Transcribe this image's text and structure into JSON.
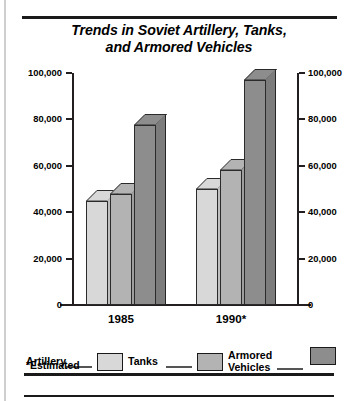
{
  "chart_data": {
    "type": "bar",
    "title": "Trends in Soviet Artillery, Tanks, and Armored Vehicles",
    "title_line1": "Trends in Soviet Artillery, Tanks,",
    "title_line2": "and Armored Vehicles",
    "categories": [
      "1985",
      "1990*"
    ],
    "series": [
      {
        "name": "Artillery",
        "values": [
          45000,
          50000
        ],
        "color": "#d8d8d8"
      },
      {
        "name": "Tanks",
        "values": [
          48000,
          58000
        ],
        "color": "#b3b3b3"
      },
      {
        "name": "Armored\nVehicles",
        "values": [
          77500,
          97000
        ],
        "color": "#8d8d8d"
      }
    ],
    "xlabel": "",
    "ylabel": "",
    "ylim": [
      0,
      100000
    ],
    "ytick_values": [
      0,
      20000,
      40000,
      60000,
      80000,
      100000
    ],
    "ytick_labels": [
      "0",
      "20,000",
      "40,000",
      "60,000",
      "80,000",
      "100,000"
    ],
    "ytick_labels_right": [
      "0",
      "20,000",
      "40,000",
      "60,000",
      "80,000",
      "100,000"
    ],
    "grid": false,
    "dual_y_axis": true,
    "legend_position": "bottom",
    "footnote": "*Estimated",
    "annotations": []
  },
  "legend": {
    "entries": [
      {
        "label": "Artillery",
        "color": "#d8d8d8"
      },
      {
        "label": "Tanks",
        "color": "#b3b3b3"
      },
      {
        "label": "Armored\nVehicles",
        "color": "#8d8d8d"
      }
    ]
  },
  "colors": {
    "artillery": "#d8d8d8",
    "tanks": "#b3b3b3",
    "armored_vehicles": "#8d8d8d",
    "outline": "#2b2b2b",
    "axis": "#231f20",
    "background": "#ffffff"
  }
}
